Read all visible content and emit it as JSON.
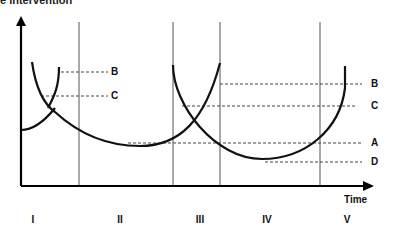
{
  "title": "e intervention",
  "axes": {
    "x_label": "Time"
  },
  "left_labels": {
    "B": "B",
    "C": "C"
  },
  "right_labels": {
    "B": "B",
    "C": "C",
    "A": "A",
    "D": "D"
  },
  "phases": [
    "I",
    "II",
    "III",
    "IV",
    "V"
  ]
}
